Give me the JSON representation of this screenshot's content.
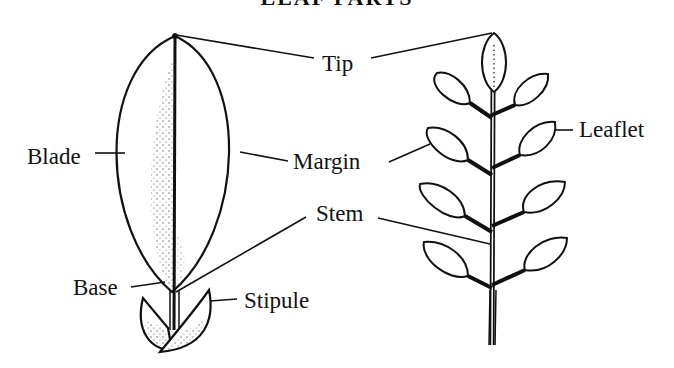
{
  "title": "LEAF PARTS",
  "labels": {
    "tip": "Tip",
    "blade": "Blade",
    "margin": "Margin",
    "stem": "Stem",
    "base": "Base",
    "stipule": "Stipule",
    "leaflet": "Leaflet"
  },
  "figures": {
    "simple_leaf": "simple leaf diagram",
    "compound_leaf": "compound leaf diagram"
  },
  "colors": {
    "ink": "#111111",
    "background": "#ffffff"
  }
}
